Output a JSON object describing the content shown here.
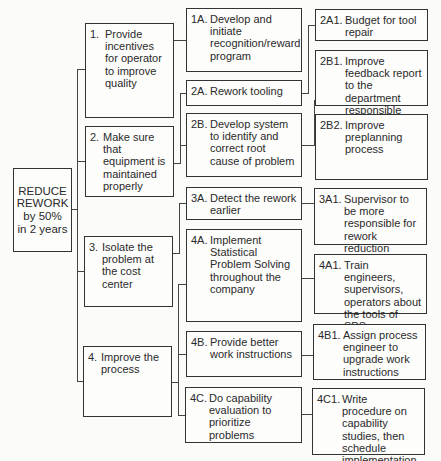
{
  "root": {
    "label": "REDUCE REWORK by 50% in 2 years",
    "lines": [
      "REDUCE",
      "REWORK",
      "by 50%",
      "in 2 years"
    ]
  },
  "level1": [
    {
      "num": "1.",
      "text": "Provide incentives for operator to improve quality"
    },
    {
      "num": "2.",
      "text": "Make sure that equipment is maintained properly"
    },
    {
      "num": "3.",
      "text": "Isolate the problem at the cost center"
    },
    {
      "num": "4.",
      "text": "Improve the process"
    }
  ],
  "level2": [
    {
      "num": "1A.",
      "text": "Develop and initiate recognition/reward program"
    },
    {
      "num": "2A.",
      "text": "Rework tooling"
    },
    {
      "num": "2B.",
      "text": "Develop system to identify and correct root cause of problem"
    },
    {
      "num": "3A.",
      "text": "Detect the rework earlier"
    },
    {
      "num": "4A.",
      "text": "Implement Statistical Problem Solving throughout the company"
    },
    {
      "num": "4B.",
      "text": "Provide better work instructions"
    },
    {
      "num": "4C.",
      "text": "Do capability evaluation to prioritize problems"
    }
  ],
  "level3": [
    {
      "num": "2A1.",
      "text": "Budget for tool repair"
    },
    {
      "num": "2B1.",
      "text": "Improve feedback report to the department responsible"
    },
    {
      "num": "2B2.",
      "text": "Improve preplanning process"
    },
    {
      "num": "3A1.",
      "text": "Supervisor to be more responsible for rework reduction"
    },
    {
      "num": "4A1.",
      "text": "Train engineers, supervisors, operators about the tools of SPS"
    },
    {
      "num": "4B1.",
      "text": "Assign process engineer to upgrade work instructions"
    },
    {
      "num": "4C1.",
      "text": "Write procedure on capability studies, then schedule implementation"
    }
  ]
}
